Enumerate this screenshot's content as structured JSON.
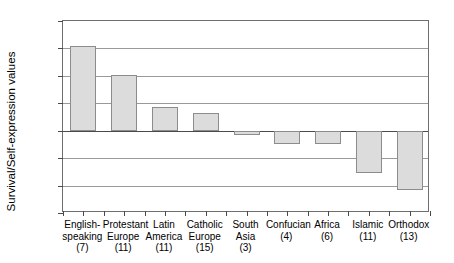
{
  "chart_data": {
    "type": "bar",
    "title": "",
    "xlabel": "",
    "ylabel": "Survival/Self-expression values",
    "ylim": [
      -1.5,
      2
    ],
    "yticks": [
      2,
      1.5,
      1,
      0.5,
      0,
      -0.5,
      -1,
      -1.5
    ],
    "ytick_labels": [
      "2",
      "1.5",
      "1",
      "0.5",
      "0",
      "−0.5",
      "−1",
      "−1.5"
    ],
    "grid": true,
    "legend": "none",
    "categories": [
      "English-speaking (7)",
      "Protestant Europe (11)",
      "Latin America (11)",
      "Catholic Europe (15)",
      "South Asia (3)",
      "Confucian (4)",
      "Africa (6)",
      "Islamic (11)",
      "Orthodox (13)"
    ],
    "category_lines": [
      [
        "English-",
        "speaking",
        "(7)"
      ],
      [
        "Protestant",
        "Europe",
        "(11)"
      ],
      [
        "Latin",
        "America",
        "(11)"
      ],
      [
        "Catholic",
        "Europe",
        "(15)"
      ],
      [
        "South",
        "Asia",
        "(3)"
      ],
      [
        "Confucian",
        "(4)"
      ],
      [
        "Africa",
        "(6)"
      ],
      [
        "Islamic",
        "(11)"
      ],
      [
        "Orthodox",
        "(13)"
      ]
    ],
    "counts": [
      7,
      11,
      11,
      15,
      3,
      4,
      6,
      11,
      13
    ],
    "values": [
      1.55,
      1.02,
      0.43,
      0.32,
      -0.08,
      -0.25,
      -0.25,
      -0.78,
      -1.08
    ],
    "colors": {
      "bar_fill": "#dcdcdc",
      "bar_border": "#8c8c8c",
      "gridline": "#9a9a9a",
      "axis": "#4a4a4a",
      "frame": "#6e6e6e",
      "text": "#000000",
      "background": "#ffffff"
    }
  }
}
